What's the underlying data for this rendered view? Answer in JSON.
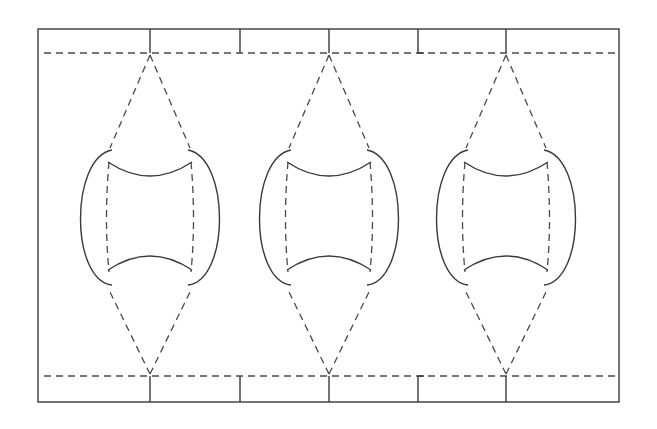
{
  "diagram": {
    "colors": {
      "stroke": "#3a3a3a",
      "background": "#ffffff"
    },
    "frame": {
      "x": 38,
      "y": 29,
      "width": 581,
      "height": 373
    },
    "dashed_lines_y": [
      53,
      376
    ],
    "top_ticks_x": [
      150,
      240,
      329,
      418,
      506
    ],
    "bottom_ticks_x": [
      150,
      240,
      329,
      418,
      506
    ],
    "units": [
      {
        "center_x": 150
      },
      {
        "center_x": 329
      },
      {
        "center_x": 506
      }
    ]
  }
}
